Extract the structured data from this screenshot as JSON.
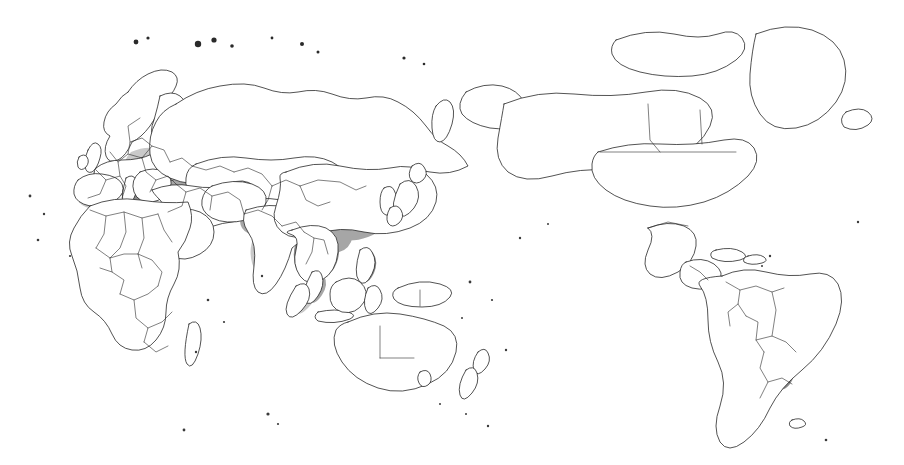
{
  "figure": {
    "kind": "world-distribution-map",
    "projection_note": "Pacific-centred world outline map",
    "title": "",
    "subtitle": "",
    "caption": "",
    "legend": {
      "present": false,
      "entries": []
    },
    "colors": {
      "background": "#ffffff",
      "outline": "#1a1a1a",
      "border": "#2b2b2b",
      "shade_light": "#c9c9c9",
      "shade_mid": "#a6a6a6",
      "shade_dark": "#8a8a8a",
      "shade_core": "#707070"
    },
    "shaded_regions": [
      {
        "name": "Iberian Mediterranean coast",
        "intensity": "light"
      },
      {
        "name": "Southern France and Italy",
        "intensity": "mid"
      },
      {
        "name": "Balkans and Greece",
        "intensity": "dark"
      },
      {
        "name": "Central Europe",
        "intensity": "light"
      },
      {
        "name": "Black Sea and Turkey",
        "intensity": "mid"
      },
      {
        "name": "Caucasus and Caspian",
        "intensity": "dark"
      },
      {
        "name": "Northern Iran and Central Asia",
        "intensity": "mid"
      },
      {
        "name": "Northern India and Gangetic plain",
        "intensity": "mid"
      },
      {
        "name": "Southern India",
        "intensity": "light"
      },
      {
        "name": "Bangladesh and Myanmar",
        "intensity": "dark"
      },
      {
        "name": "Eastern China",
        "intensity": "mid"
      },
      {
        "name": "Korean peninsula",
        "intensity": "mid"
      },
      {
        "name": "Japan",
        "intensity": "mid"
      },
      {
        "name": "Indochina: Thailand, Laos, Vietnam, Cambodia",
        "intensity": "dark"
      },
      {
        "name": "Malay peninsula and Sumatra",
        "intensity": "mid"
      },
      {
        "name": "Philippines",
        "intensity": "dark"
      },
      {
        "name": "Nile delta",
        "intensity": "light"
      },
      {
        "name": "Northern Morocco",
        "intensity": "dark"
      },
      {
        "name": "Madagascar highlands",
        "intensity": "light"
      },
      {
        "name": "Southern Brazil, Uruguay and northeast Argentina",
        "intensity": "mid"
      },
      {
        "name": "Colombia",
        "intensity": "light"
      },
      {
        "name": "Central Mexico",
        "intensity": "light"
      }
    ],
    "unshaded_regions": [
      "Greenland",
      "Canada",
      "United States",
      "Alaska",
      "Scandinavia",
      "Northern Russia and Siberia",
      "Mongolia",
      "Sahara and Sub-Saharan Africa",
      "Arabian peninsula",
      "Australia",
      "New Zealand",
      "Amazon basin",
      "Patagonia"
    ]
  }
}
